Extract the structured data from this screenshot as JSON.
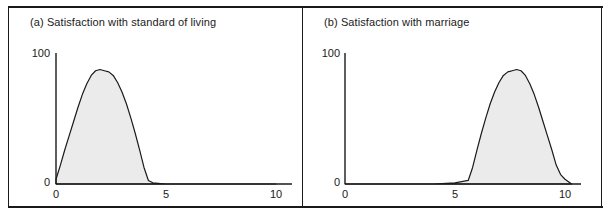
{
  "figure": {
    "panels": [
      {
        "id": "a",
        "title": "(a) Satisfaction with standard of living",
        "yaxis": {
          "ticks": [
            "100",
            "0"
          ]
        },
        "xaxis": {
          "ticks": [
            "0",
            "5",
            "10"
          ]
        }
      },
      {
        "id": "b",
        "title": "(b) Satisfaction with marriage",
        "yaxis": {
          "ticks": [
            "100",
            "0"
          ]
        },
        "xaxis": {
          "ticks": [
            "0",
            "5",
            "10"
          ]
        }
      }
    ],
    "colors": {
      "line": "#1a1a1a",
      "fill": "#ebebeb",
      "frame": "#1a1a1a",
      "background": "#ffffff"
    }
  },
  "chart_data": [
    {
      "type": "area",
      "title": "(a) Satisfaction with standard of living",
      "xlabel": "",
      "ylabel": "",
      "xlim": [
        0,
        10
      ],
      "ylim": [
        0,
        105
      ],
      "xticks": [
        0,
        5,
        10
      ],
      "yticks": [
        0,
        100
      ],
      "grid": false,
      "legend": "none",
      "x": [
        0.0,
        0.2,
        0.4,
        0.6,
        0.8,
        1.0,
        1.2,
        1.4,
        1.6,
        1.8,
        2.0,
        2.2,
        2.4,
        2.6,
        2.8,
        3.0,
        3.2,
        3.4,
        3.6,
        3.8,
        4.0,
        4.2,
        4.4,
        5.0,
        6.0,
        7.0,
        8.0,
        9.0,
        10.0
      ],
      "y": [
        4,
        16,
        29,
        41,
        53,
        65,
        76,
        85,
        92,
        96,
        97,
        96,
        95,
        92,
        86,
        78,
        68,
        56,
        43,
        29,
        14,
        3,
        1,
        0,
        0,
        0,
        0,
        0,
        0
      ]
    },
    {
      "type": "area",
      "title": "(b) Satisfaction with marriage",
      "xlabel": "",
      "ylabel": "",
      "xlim": [
        0,
        10
      ],
      "ylim": [
        0,
        105
      ],
      "xticks": [
        0,
        5,
        10
      ],
      "yticks": [
        0,
        100
      ],
      "grid": false,
      "legend": "none",
      "x": [
        0.0,
        1.0,
        2.0,
        3.0,
        4.0,
        5.0,
        5.6,
        5.8,
        6.0,
        6.2,
        6.4,
        6.6,
        6.8,
        7.0,
        7.2,
        7.4,
        7.6,
        7.8,
        8.0,
        8.2,
        8.4,
        8.6,
        8.8,
        9.0,
        9.2,
        9.4,
        9.6,
        9.8,
        10.0,
        10.3
      ],
      "y": [
        0,
        0,
        0,
        0,
        0,
        1,
        3,
        14,
        29,
        43,
        56,
        68,
        78,
        86,
        92,
        95,
        96,
        97,
        96,
        92,
        85,
        76,
        65,
        53,
        41,
        29,
        16,
        8,
        4,
        0
      ]
    }
  ]
}
